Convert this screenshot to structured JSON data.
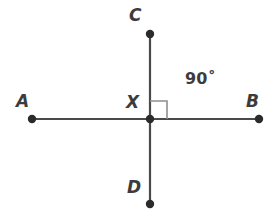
{
  "figure": {
    "background_color": "#ffffff",
    "line_color": "#4a4a4a",
    "point_color": "#2b2b2b",
    "marker_color": "#8a8a8a",
    "text_color": "#3c3c3c"
  },
  "labels": {
    "a": "A",
    "b": "B",
    "c": "C",
    "d": "D",
    "x": "X",
    "angle": "90˚"
  },
  "points": [
    {
      "name": "A",
      "x": 32,
      "y": 119
    },
    {
      "name": "B",
      "x": 259,
      "y": 119
    },
    {
      "name": "C",
      "x": 150,
      "y": 34
    },
    {
      "name": "D",
      "x": 150,
      "y": 204
    },
    {
      "name": "X",
      "x": 150,
      "y": 119
    }
  ],
  "segments": [
    {
      "name": "line-AB",
      "x1": 32,
      "y1": 119,
      "x2": 259,
      "y2": 119
    },
    {
      "name": "line-CD",
      "x1": 150,
      "y1": 34,
      "x2": 150,
      "y2": 204
    }
  ],
  "right_angle_marker": {
    "x": 150,
    "y": 101,
    "size": 17
  }
}
